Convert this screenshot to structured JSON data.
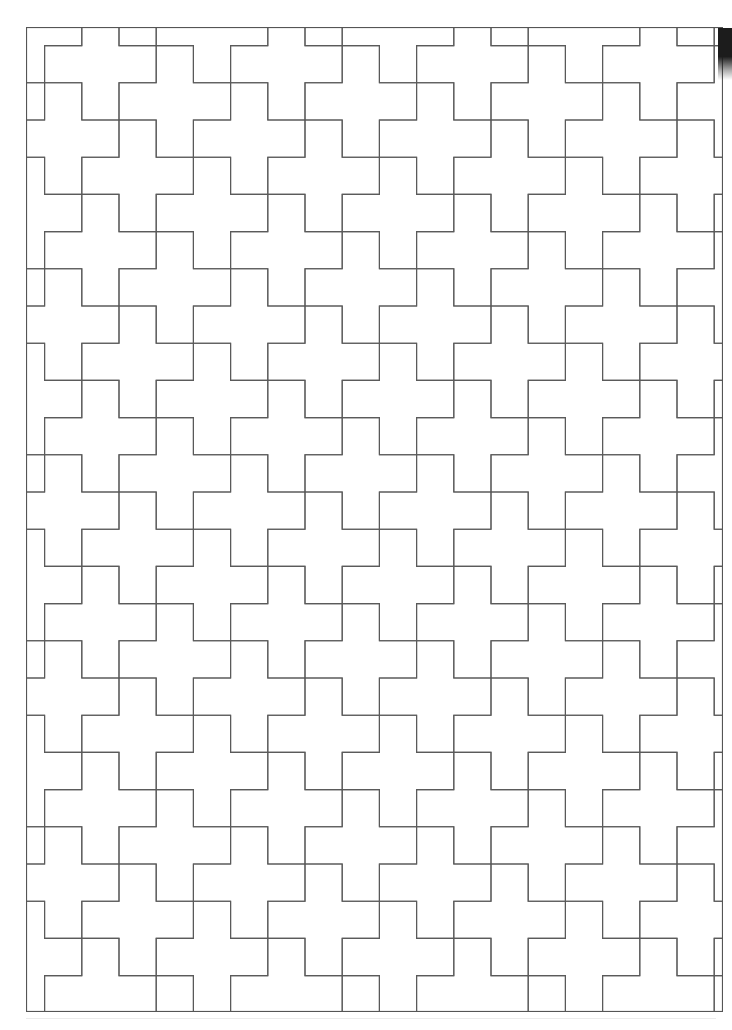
{
  "document": {
    "title": "Cross Tessellation Pattern",
    "kind": "line-art-tessellation",
    "background_color": "#ffffff",
    "canvas": {
      "width": 732,
      "height": 1030
    }
  },
  "pattern": {
    "name": "greek-cross-tessellation",
    "description": "Plane tessellation of Greek crosses (plus pentominoes) drawn as thin outlines on white paper",
    "tile_shape": "greek-cross",
    "stroke_color": "#5a5a5a",
    "stroke_width": 1.1,
    "fill_color": "none",
    "unit_px": 37.2,
    "origin_x": 26,
    "origin_y": 27,
    "frame": {
      "x": 26,
      "y": 27,
      "width": 697,
      "height": 985
    },
    "frame_stroke_color": "#555555",
    "lattice_vector_a": [
      2,
      1
    ],
    "lattice_vector_b": [
      1,
      -2
    ],
    "lattice_range_i": [
      -14,
      14
    ],
    "lattice_range_j": [
      -14,
      14
    ],
    "cols_across": 18.7,
    "rows_down": 26.5
  },
  "artifacts": {
    "page_edge_shadow": {
      "x": 718,
      "y": 28,
      "width": 14,
      "height": 52,
      "color": "#1c1c1c"
    },
    "scan_baseline": {
      "x": 26,
      "y": 1018,
      "width": 690,
      "height": 1,
      "color": "#ebebeb"
    }
  }
}
